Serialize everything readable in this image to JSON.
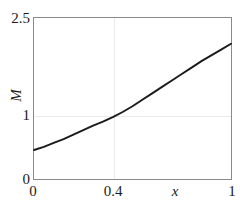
{
  "chart_data": {
    "type": "line",
    "title": "",
    "subtitle": "",
    "xlabel": "x",
    "ylabel": "M",
    "xlim": [
      0,
      1
    ],
    "ylim": [
      0,
      2.5
    ],
    "grid": true,
    "legend": null,
    "xticks": [
      {
        "value": 0,
        "label": "0"
      },
      {
        "value": 0.4,
        "label": "0.4"
      },
      {
        "value": 1,
        "label": "1"
      }
    ],
    "yticks": [
      {
        "value": 0,
        "label": "0"
      },
      {
        "value": 1,
        "label": "1"
      },
      {
        "value": 2.5,
        "label": "2.5"
      }
    ],
    "series": [
      {
        "name": "M(x)",
        "color": "#1a1a1a",
        "linewidth": 1.9,
        "x": [
          0.0,
          0.05,
          0.1,
          0.15,
          0.2,
          0.25,
          0.3,
          0.35,
          0.4,
          0.45,
          0.5,
          0.55,
          0.6,
          0.65,
          0.7,
          0.75,
          0.8,
          0.85,
          0.9,
          0.95,
          1.0
        ],
        "values": [
          0.45,
          0.5,
          0.56,
          0.62,
          0.69,
          0.76,
          0.83,
          0.89,
          0.96,
          1.04,
          1.13,
          1.23,
          1.33,
          1.43,
          1.53,
          1.63,
          1.73,
          1.83,
          1.92,
          2.01,
          2.1
        ]
      }
    ]
  },
  "axes": {
    "ylabel_text": "M",
    "xlabel_text": "x",
    "ytop_label": "2.5",
    "ymid_label": "1",
    "ybottom_label": "0",
    "xleft_label": "0",
    "xmid_label": "0.4",
    "xright_label": "1"
  }
}
